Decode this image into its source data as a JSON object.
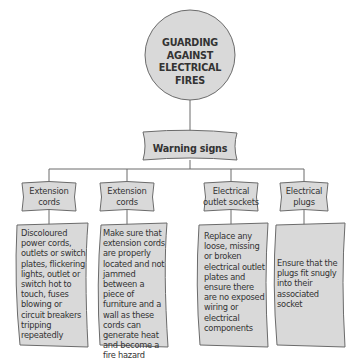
{
  "diagram": {
    "title": "GUARDING AGAINST ELECTRICAL FIRES",
    "subtitle": "Warning signs",
    "colors": {
      "fill": "#d9d9d9",
      "stroke": "#6b6b6b",
      "text": "#333333"
    },
    "categories": [
      {
        "label": "Extension cords",
        "text": "Discoloured power cords, outlets or switch plates, flickering lights, outlet or switch hot to touch, fuses blowing or circuit breakers tripping repeatedly"
      },
      {
        "label": "Extension cords",
        "text": "Make sure that extension cords are properly located and not jammed between a piece of furniture and a wall as these cords can generate heat and become a fire hazard"
      },
      {
        "label": "Electrical outlet sockets",
        "text": "Replace any loose, missing or broken electrical outlet plates and ensure there are no exposed wiring or electrical components"
      },
      {
        "label": "Electrical plugs",
        "text": "Ensure that the plugs fit snugly into their associated socket"
      }
    ]
  }
}
